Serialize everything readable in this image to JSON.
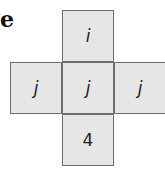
{
  "label": "e",
  "net": {
    "description": "Cross-shaped net of a cube",
    "face_color": "#e6e6e6",
    "border_color": "#6e6e6e",
    "faces": {
      "top": "i",
      "left": "j",
      "center": "j",
      "right": "j",
      "bottom": "4"
    }
  }
}
